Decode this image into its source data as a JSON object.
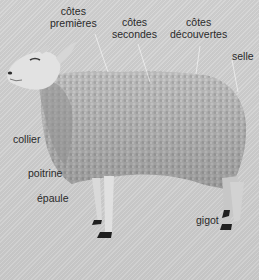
{
  "diagram": {
    "background_color": "#cfcfcf",
    "text_color": "#2a2a2a",
    "labels": [
      {
        "id": "cotes-premieres",
        "lines": [
          "côtes",
          "premières"
        ]
      },
      {
        "id": "cotes-secondes",
        "lines": [
          "côtes",
          "secondes"
        ]
      },
      {
        "id": "cotes-decouvertes",
        "lines": [
          "côtes",
          "découvertes"
        ]
      },
      {
        "id": "selle",
        "lines": [
          "selle"
        ]
      },
      {
        "id": "collier",
        "lines": [
          "collier"
        ]
      },
      {
        "id": "poitrine",
        "lines": [
          "poitrine"
        ]
      },
      {
        "id": "epaule",
        "lines": [
          "épaule"
        ]
      },
      {
        "id": "gigot",
        "lines": [
          "gigot"
        ]
      }
    ]
  }
}
